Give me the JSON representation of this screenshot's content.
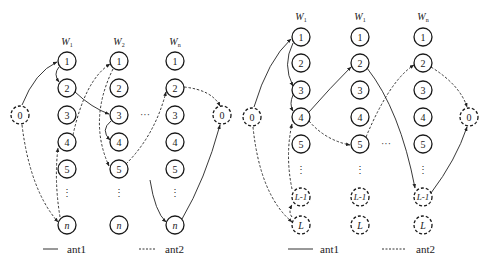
{
  "diagrams": [
    {
      "id": "left",
      "columns": [
        {
          "label": "W",
          "sub": "1",
          "nodes": [
            "1",
            "2",
            "3",
            "4",
            "5",
            "⋮",
            "n"
          ]
        },
        {
          "label": "W",
          "sub": "2",
          "nodes": [
            "1",
            "2",
            "3",
            "4",
            "5",
            "⋮",
            "n"
          ]
        },
        {
          "label": "W",
          "sub": "n",
          "nodes": [
            "1",
            "2",
            "3",
            "4",
            "5",
            "⋮",
            "n"
          ]
        }
      ],
      "start_node": "0",
      "end_node": "0",
      "ellipsis": "···",
      "paths": {
        "ant1": [
          "0",
          "W1.1",
          "W1.2",
          "W2.3",
          "W2.4",
          "…",
          "Wn.n",
          "0"
        ],
        "ant2": [
          "0",
          "W1.n",
          "W1.4",
          "W2.1",
          "W2.5",
          "Wn.2",
          "0"
        ]
      }
    },
    {
      "id": "right",
      "columns": [
        {
          "label": "W",
          "sub": "1",
          "nodes": [
            "1",
            "2",
            "3",
            "4",
            "5",
            "⋮",
            "L-1",
            "L"
          ]
        },
        {
          "label": "W",
          "sub": "1",
          "nodes": [
            "1",
            "2",
            "3",
            "4",
            "5",
            "⋮",
            "L-1",
            "L"
          ]
        },
        {
          "label": "W",
          "sub": "n",
          "nodes": [
            "1",
            "2",
            "3",
            "4",
            "5",
            "⋮",
            "L-1",
            "L"
          ]
        }
      ],
      "start_node": "0",
      "end_node": "0",
      "ellipsis": "···",
      "paths": {
        "ant1": [
          "0",
          "W1.1",
          "W1.3",
          "W1.4",
          "W2.2",
          "Wn.L-1",
          "0"
        ],
        "ant2": [
          "0",
          "W1.L",
          "W1.L-1",
          "W1.4",
          "W2.5",
          "Wn.2",
          "0"
        ]
      }
    }
  ],
  "legend": [
    {
      "label": "ant1",
      "style": "solid"
    },
    {
      "label": "ant2",
      "style": "dashed"
    }
  ],
  "colors": {
    "stroke": "#1a1a1a",
    "background": "#ffffff"
  }
}
